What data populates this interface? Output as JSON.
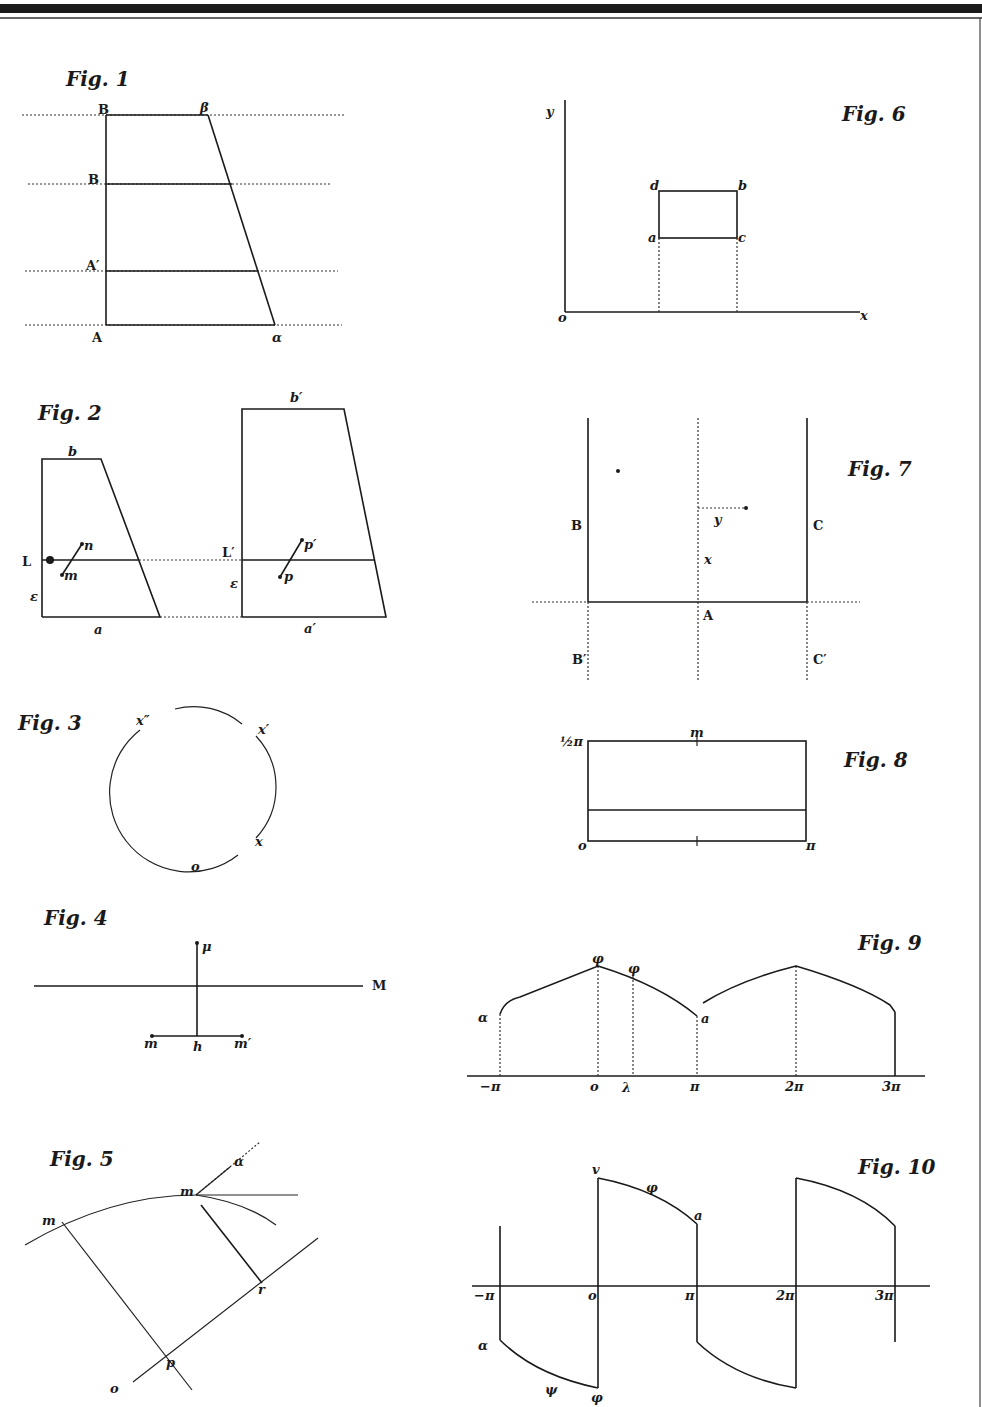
{
  "plate": {
    "border_color": "#1a1a1a",
    "ink_color": "#1a1a1a",
    "paper_color": "#ffffff"
  },
  "figures": {
    "fig1": {
      "title": "Fig. 1",
      "labels": {
        "B_top": "B",
        "beta": "β",
        "B_mid": "B",
        "A_prime": "A′",
        "A": "A",
        "alpha": "α"
      }
    },
    "fig2": {
      "title": "Fig. 2",
      "left": {
        "b": "b",
        "L": "L",
        "n": "n",
        "m": "m",
        "epsilon": "ε",
        "a": "a"
      },
      "right": {
        "b_prime": "b′",
        "L_prime": "L′",
        "p_prime": "p′",
        "p": "p",
        "epsilon": "ε",
        "a_prime": "a′"
      }
    },
    "fig3": {
      "title": "Fig. 3",
      "labels": {
        "x_dprime": "x″",
        "x_prime": "x′",
        "x": "x",
        "o": "o"
      }
    },
    "fig4": {
      "title": "Fig. 4",
      "labels": {
        "mu": "μ",
        "M": "M",
        "m": "m",
        "h": "h",
        "m_prime": "m′"
      }
    },
    "fig5": {
      "title": "Fig. 5",
      "labels": {
        "alpha": "α",
        "m_top": "m",
        "m_left": "m",
        "r": "r",
        "p": "p",
        "o": "o"
      }
    },
    "fig6": {
      "title": "Fig. 6",
      "labels": {
        "y": "y",
        "d": "d",
        "b": "b",
        "a": "a",
        "c": "c",
        "o": "o",
        "x": "x"
      }
    },
    "fig7": {
      "title": "Fig. 7",
      "labels": {
        "B": "B",
        "C": "C",
        "y": "y",
        "x": "x",
        "A": "A",
        "B_prime": "B′",
        "C_prime": "C′"
      }
    },
    "fig8": {
      "title": "Fig. 8",
      "labels": {
        "half_pi": "½π",
        "m": "m",
        "o": "o",
        "pi": "π"
      }
    },
    "fig9": {
      "title": "Fig. 9",
      "labels": {
        "alpha": "α",
        "phi1": "φ",
        "phi2": "φ",
        "a": "a"
      },
      "ticks": [
        "−π",
        "o",
        "λ",
        "π",
        "2π",
        "3π"
      ]
    },
    "fig10": {
      "title": "Fig. 10",
      "labels": {
        "v": "v",
        "phi_up": "φ",
        "a": "a",
        "alpha": "α",
        "psi": "ψ",
        "phi_down": "φ"
      },
      "ticks": [
        "−π",
        "o",
        "π",
        "2π",
        "3π"
      ]
    }
  }
}
